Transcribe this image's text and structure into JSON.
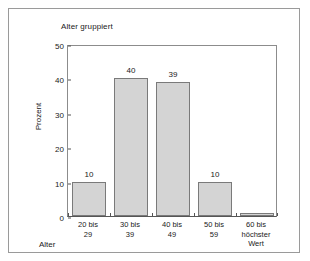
{
  "figure": {
    "background": "#ffffff",
    "frame_color": "#9a9a9a"
  },
  "chart_data": {
    "type": "bar",
    "title": "Alter gruppiert",
    "xlabel": "Alter",
    "ylabel": "Prozent",
    "categories": [
      "20 bis 29",
      "30 bis 39",
      "40 bis 49",
      "50 bis 59",
      "60 bis höchster Wert"
    ],
    "category_lines": [
      [
        "20 bis",
        "29"
      ],
      [
        "30 bis",
        "39"
      ],
      [
        "40 bis",
        "49"
      ],
      [
        "50 bis",
        "59"
      ],
      [
        "60 bis",
        "höchster",
        "Wert"
      ]
    ],
    "values": [
      10,
      40,
      39,
      10,
      1
    ],
    "data_labels": [
      "10",
      "40",
      "39",
      "10",
      ""
    ],
    "ylim": [
      0,
      50
    ],
    "yticks": [
      0,
      10,
      20,
      30,
      40,
      50
    ],
    "ytick_labels": [
      "0",
      "10",
      "20",
      "30",
      "40",
      "50"
    ],
    "grid": false,
    "legend": false,
    "bar_fill": "#d4d4d4",
    "bar_border": "#7a7a7a"
  }
}
